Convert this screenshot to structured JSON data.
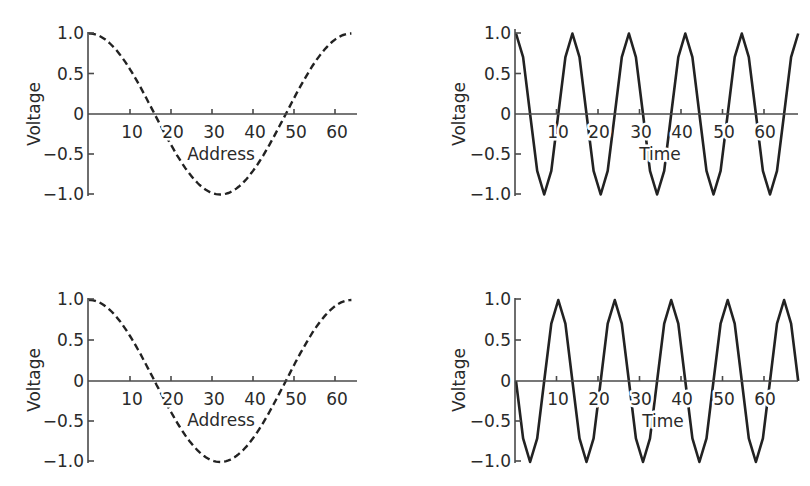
{
  "chart_data": [
    {
      "id": "top-left",
      "type": "line",
      "title": "",
      "xlabel": "Address",
      "ylabel": "Voltage",
      "line_style": "dashed",
      "xlim": [
        0,
        64
      ],
      "ylim": [
        -1.0,
        1.0
      ],
      "x_ticks": [
        "10",
        "20",
        "30",
        "40",
        "50",
        "60"
      ],
      "y_ticks": [
        "1.0",
        "0.5",
        "0",
        "-0.5",
        "-1.0"
      ],
      "function": "cos(2*pi*x/64)",
      "x": [
        0,
        4,
        8,
        12,
        16,
        20,
        24,
        28,
        32,
        36,
        40,
        44,
        48,
        52,
        56,
        60,
        63
      ],
      "values": [
        1.0,
        0.92,
        0.71,
        0.38,
        0.0,
        -0.38,
        -0.71,
        -0.92,
        -1.0,
        -0.92,
        -0.71,
        -0.38,
        0.0,
        0.38,
        0.71,
        0.92,
        1.0
      ]
    },
    {
      "id": "top-right",
      "type": "line",
      "title": "",
      "xlabel": "Time",
      "ylabel": "Voltage",
      "line_style": "solid",
      "xlim": [
        0,
        68
      ],
      "ylim": [
        -1.0,
        1.0
      ],
      "x_ticks": [
        "10",
        "20",
        "30",
        "40",
        "50",
        "60"
      ],
      "y_ticks": [
        "1.0",
        "0.5",
        "0",
        "-0.5",
        "-1.0"
      ],
      "function": "cos(2*pi*t/13.6)",
      "x": [
        0,
        3.4,
        6.8,
        10.2,
        13.6,
        17,
        20.4,
        23.8,
        27.2,
        30.6,
        34,
        37.4,
        40.8,
        44.2,
        47.6,
        51,
        54.4,
        57.8,
        61.2,
        64.6,
        68
      ],
      "values": [
        1.0,
        0.0,
        -1.0,
        0.0,
        1.0,
        0.0,
        -1.0,
        0.0,
        1.0,
        0.0,
        -1.0,
        0.0,
        1.0,
        0.0,
        -1.0,
        0.0,
        1.0,
        0.0,
        -1.0,
        0.0,
        1.0
      ]
    },
    {
      "id": "bottom-left",
      "type": "line",
      "title": "",
      "xlabel": "Address",
      "ylabel": "Voltage",
      "line_style": "dashed",
      "xlim": [
        0,
        64
      ],
      "ylim": [
        -1.0,
        1.0
      ],
      "x_ticks": [
        "10",
        "20",
        "30",
        "40",
        "50",
        "60"
      ],
      "y_ticks": [
        "1.0",
        "0.5",
        "0",
        "-0.5",
        "-1.0"
      ],
      "function": "cos(2*pi*x/64)",
      "x": [
        0,
        4,
        8,
        12,
        16,
        20,
        24,
        28,
        32,
        36,
        40,
        44,
        48,
        52,
        56,
        60,
        63
      ],
      "values": [
        1.0,
        0.92,
        0.71,
        0.38,
        0.0,
        -0.38,
        -0.71,
        -0.92,
        -1.0,
        -0.92,
        -0.71,
        -0.38,
        0.0,
        0.38,
        0.71,
        0.92,
        1.0
      ]
    },
    {
      "id": "bottom-right",
      "type": "line",
      "title": "",
      "xlabel": "Time",
      "ylabel": "Voltage",
      "line_style": "solid",
      "xlim": [
        0,
        68
      ],
      "ylim": [
        -1.0,
        1.0
      ],
      "x_ticks": [
        "10",
        "20",
        "30",
        "40",
        "50",
        "60"
      ],
      "y_ticks": [
        "1.0",
        "0.5",
        "0",
        "-0.5",
        "-1.0"
      ],
      "function": "-sin(2*pi*t/13.6)",
      "x": [
        0,
        3.4,
        6.8,
        10.2,
        13.6,
        17,
        20.4,
        23.8,
        27.2,
        30.6,
        34,
        37.4,
        40.8,
        44.2,
        47.6,
        51,
        54.4,
        57.8,
        61.2,
        64.6,
        68
      ],
      "values": [
        0.0,
        -1.0,
        0.0,
        1.0,
        0.0,
        -1.0,
        0.0,
        1.0,
        0.0,
        -1.0,
        0.0,
        1.0,
        0.0,
        -1.0,
        0.0,
        1.0,
        0.0,
        -1.0,
        0.0,
        1.0,
        0.4
      ]
    }
  ],
  "panels": [
    {
      "ylabel": "Voltage",
      "xlabel": "Address",
      "yticks": [
        "1.0",
        "0.5",
        "0",
        "−0.5",
        "−1.0"
      ],
      "xticks": [
        "10",
        "20",
        "30",
        "40",
        "50",
        "60"
      ]
    },
    {
      "ylabel": "Voltage",
      "xlabel": "Time",
      "yticks": [
        "1.0",
        "0.5",
        "0",
        "−0.5",
        "−1.0"
      ],
      "xticks": [
        "10",
        "20",
        "30",
        "40",
        "50",
        "60"
      ]
    },
    {
      "ylabel": "Voltage",
      "xlabel": "Address",
      "yticks": [
        "1.0",
        "0.5",
        "0",
        "−0.5",
        "−1.0"
      ],
      "xticks": [
        "10",
        "20",
        "30",
        "40",
        "50",
        "60"
      ]
    },
    {
      "ylabel": "Voltage",
      "xlabel": "Time",
      "yticks": [
        "1.0",
        "0.5",
        "0",
        "−0.5",
        "−1.0"
      ],
      "xticks": [
        "10",
        "20",
        "30",
        "40",
        "50",
        "60"
      ]
    }
  ],
  "colors": {
    "line": "#222222",
    "axis": "#4a4a4a",
    "text": "#2a2a2a",
    "background": "#ffffff"
  }
}
